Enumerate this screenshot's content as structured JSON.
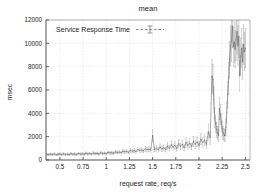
{
  "chart_data": {
    "type": "scatter",
    "title": "mean",
    "xlabel": "request rate, req/s",
    "ylabel": "msec",
    "xlim": [
      0.35,
      2.55
    ],
    "ylim": [
      0,
      12000
    ],
    "grid": true,
    "legend_position": "top-left-inside",
    "xticks": [
      0.5,
      0.75,
      1,
      1.25,
      1.5,
      1.75,
      2,
      2.25,
      2.5
    ],
    "xtick_labels": [
      "0.5",
      "0.75",
      "1",
      "1.25",
      "1.5",
      "1.75",
      "2",
      "2.25",
      "2.5"
    ],
    "yticks": [
      0,
      2000,
      4000,
      6000,
      8000,
      10000,
      12000
    ],
    "ytick_labels": [
      "0",
      "2000",
      "4000",
      "6000",
      "8000",
      "10000",
      "12000"
    ],
    "series": [
      {
        "name": "Service Response Time",
        "color": "#555555",
        "style": "points-with-errorbars",
        "x": [
          0.36,
          0.38,
          0.4,
          0.42,
          0.44,
          0.46,
          0.48,
          0.5,
          0.52,
          0.54,
          0.56,
          0.58,
          0.6,
          0.62,
          0.64,
          0.66,
          0.68,
          0.7,
          0.72,
          0.74,
          0.76,
          0.78,
          0.8,
          0.82,
          0.84,
          0.86,
          0.88,
          0.9,
          0.92,
          0.94,
          0.96,
          0.98,
          1.0,
          1.02,
          1.04,
          1.06,
          1.08,
          1.1,
          1.12,
          1.14,
          1.16,
          1.18,
          1.2,
          1.22,
          1.24,
          1.26,
          1.28,
          1.3,
          1.32,
          1.34,
          1.36,
          1.38,
          1.4,
          1.42,
          1.44,
          1.46,
          1.48,
          1.5,
          1.52,
          1.54,
          1.56,
          1.58,
          1.6,
          1.62,
          1.64,
          1.66,
          1.68,
          1.7,
          1.72,
          1.74,
          1.76,
          1.78,
          1.8,
          1.82,
          1.84,
          1.86,
          1.88,
          1.9,
          1.92,
          1.94,
          1.96,
          1.98,
          2.0,
          2.02,
          2.04,
          2.06,
          2.08,
          2.1,
          2.12,
          2.14,
          2.15,
          2.16,
          2.17,
          2.18,
          2.19,
          2.2,
          2.21,
          2.22,
          2.23,
          2.24,
          2.25,
          2.26,
          2.27,
          2.28,
          2.29,
          2.3,
          2.31,
          2.32,
          2.33,
          2.34,
          2.35,
          2.36,
          2.37,
          2.38,
          2.39,
          2.4,
          2.41,
          2.42,
          2.43,
          2.44,
          2.45,
          2.46,
          2.47,
          2.48,
          2.49,
          2.5
        ],
        "y": [
          480,
          460,
          500,
          470,
          520,
          450,
          490,
          510,
          470,
          530,
          480,
          500,
          460,
          540,
          490,
          520,
          470,
          560,
          500,
          530,
          490,
          580,
          520,
          550,
          500,
          600,
          540,
          570,
          520,
          620,
          560,
          590,
          540,
          650,
          600,
          630,
          580,
          700,
          640,
          680,
          620,
          760,
          700,
          740,
          660,
          820,
          760,
          800,
          720,
          900,
          820,
          860,
          780,
          960,
          880,
          920,
          840,
          2100,
          900,
          1000,
          880,
          1100,
          960,
          1040,
          900,
          1200,
          1000,
          1300,
          1100,
          1250,
          1000,
          1400,
          1150,
          1350,
          1050,
          1500,
          1250,
          1450,
          1150,
          1600,
          1350,
          1550,
          1250,
          1800,
          1500,
          1700,
          1350,
          2400,
          1900,
          7200,
          6900,
          5200,
          3600,
          3100,
          2600,
          2300,
          2100,
          4400,
          3900,
          3200,
          2700,
          2300,
          2150,
          2100,
          2800,
          4100,
          5600,
          7000,
          8600,
          9800,
          10200,
          11500,
          9700,
          10100,
          9500,
          10300,
          11000,
          9800,
          10600,
          7200,
          8900,
          9600,
          8400,
          9900,
          9300,
          9600
        ],
        "yerr": [
          90,
          80,
          95,
          85,
          100,
          80,
          90,
          95,
          85,
          100,
          90,
          95,
          85,
          105,
          90,
          100,
          85,
          110,
          95,
          100,
          90,
          115,
          100,
          105,
          95,
          120,
          100,
          110,
          95,
          125,
          105,
          115,
          100,
          130,
          115,
          120,
          110,
          140,
          125,
          135,
          120,
          160,
          140,
          150,
          130,
          180,
          160,
          170,
          145,
          200,
          170,
          185,
          160,
          230,
          200,
          215,
          180,
          520,
          210,
          240,
          205,
          270,
          230,
          250,
          215,
          300,
          240,
          330,
          270,
          310,
          240,
          360,
          290,
          340,
          265,
          400,
          320,
          380,
          290,
          430,
          350,
          410,
          320,
          500,
          400,
          460,
          350,
          700,
          560,
          1400,
          1300,
          1100,
          850,
          750,
          650,
          580,
          540,
          950,
          880,
          760,
          650,
          560,
          520,
          510,
          680,
          900,
          1150,
          1350,
          1550,
          1700,
          1750,
          1900,
          1650,
          1720,
          1600,
          1760,
          1850,
          1680,
          1800,
          1300,
          1550,
          1650,
          1480,
          1700,
          1620,
          1660
        ]
      }
    ]
  },
  "legend": {
    "entries": [
      {
        "label": "Service Response Time"
      }
    ]
  }
}
